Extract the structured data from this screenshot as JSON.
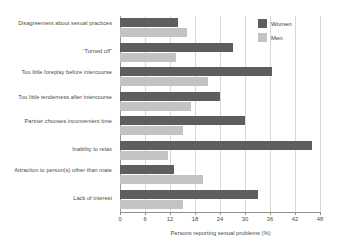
{
  "chart_data": {
    "type": "bar",
    "orientation": "horizontal",
    "title": "",
    "xlabel": "Persons reporting sexual problems (%)",
    "ylabel": "",
    "xlim": [
      0,
      48
    ],
    "xticks": [
      0,
      6,
      12,
      18,
      24,
      30,
      36,
      42,
      48
    ],
    "grid": true,
    "legend_position": "top-right",
    "categories": [
      "Disagreement about sexual practices",
      "“Turned off”",
      "Too little foreplay before intercourse",
      "Too little tenderness after intercourse",
      "Partner chooses inconvenient time",
      "Inability to relax",
      "Attraction to person(s) other than mate",
      "Lack of interest"
    ],
    "series": [
      {
        "name": "Women",
        "color": "#5e5e5e",
        "values": [
          14,
          27,
          36.5,
          24,
          30,
          46,
          13,
          33
        ]
      },
      {
        "name": "Men",
        "color": "#c3c3c3",
        "values": [
          16,
          13.5,
          21,
          17,
          15,
          11.5,
          20,
          15
        ]
      }
    ]
  },
  "legend": {
    "items": [
      {
        "label": "Women",
        "color": "#5e5e5e"
      },
      {
        "label": "Men",
        "color": "#c3c3c3"
      }
    ]
  },
  "axis": {
    "x_title": "Persons reporting sexual problems (%)",
    "tick_labels": [
      "0",
      "6",
      "12",
      "18",
      "24",
      "30",
      "36",
      "42",
      "48"
    ]
  },
  "colors": {
    "women": "#5e5e5e",
    "men": "#c3c3c3",
    "gridline": "#d8d8d8",
    "axis": "#8f8f8f",
    "text": "#4a4a4a",
    "background": "#ffffff"
  }
}
